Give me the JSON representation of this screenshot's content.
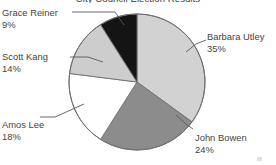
{
  "title": "City Council Election Results",
  "chart_data": {
    "type": "pie",
    "title": "City Council Election Results",
    "xlabel": "",
    "ylabel": "",
    "units": "percent",
    "total": 100,
    "start_angle_deg": 0,
    "direction": "clockwise",
    "legend": "none (direct callout labels with leader lines)",
    "grid": false,
    "categories": [
      "Barbara Utley",
      "John Bowen",
      "Amos Lee",
      "Scott Kang",
      "Grace Reiner"
    ],
    "values": [
      35,
      24,
      18,
      14,
      9
    ],
    "slices": [
      {
        "name": "Barbara Utley",
        "value": 35,
        "pct_label": "35%",
        "color": "#d2d2d2",
        "start_deg": 0,
        "end_deg": 126,
        "label_position": "right"
      },
      {
        "name": "John Bowen",
        "value": 24,
        "pct_label": "24%",
        "color": "#8c8c8c",
        "start_deg": 126,
        "end_deg": 212.4,
        "label_position": "bottom-right"
      },
      {
        "name": "Amos Lee",
        "value": 18,
        "pct_label": "18%",
        "color": "#ffffff",
        "start_deg": 212.4,
        "end_deg": 277.2,
        "label_position": "bottom-left"
      },
      {
        "name": "Scott Kang",
        "value": 14,
        "pct_label": "14%",
        "color": "#cdcdcd",
        "start_deg": 277.2,
        "end_deg": 327.6,
        "label_position": "left"
      },
      {
        "name": "Grace Reiner",
        "value": 9,
        "pct_label": "9%",
        "color": "#141414",
        "start_deg": 327.6,
        "end_deg": 360,
        "label_position": "top-left"
      }
    ]
  },
  "labels": {
    "grace": {
      "name": "Grace Reiner",
      "pct": "9%"
    },
    "scott": {
      "name": "Scott Kang",
      "pct": "14%"
    },
    "amos": {
      "name": "Amos Lee",
      "pct": "18%"
    },
    "barbara": {
      "name": "Barbara Utley",
      "pct": "35%"
    },
    "john": {
      "name": "John Bowen",
      "pct": "24%"
    }
  },
  "geometry": {
    "center_x": 137,
    "center_y": 82,
    "radius": 68
  },
  "colors": {
    "slice_light": "#d2d2d2",
    "slice_mid": "#8c8c8c",
    "slice_white": "#ffffff",
    "slice_light2": "#cdcdcd",
    "slice_black": "#141414",
    "outline": "#6f6f6f",
    "text": "#444444",
    "background": "#ffffff"
  }
}
